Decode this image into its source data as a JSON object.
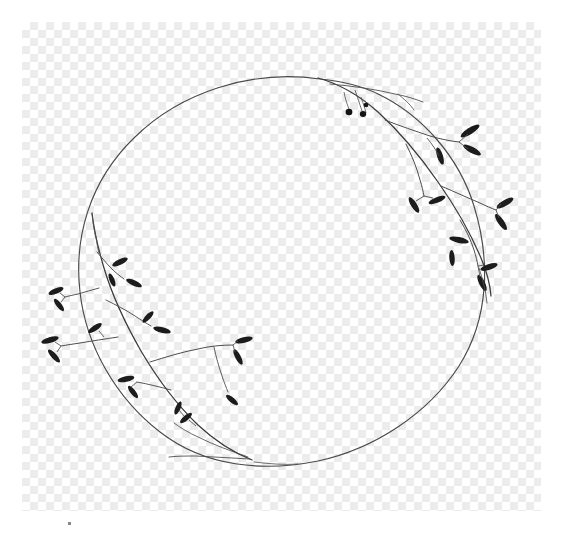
{
  "image": {
    "title": "Botanical Circle Wreath Line Drawing",
    "subject": "floral-wreath-branch-sprigs",
    "canvas_width": 566,
    "canvas_height": 534,
    "background_type": "transparency-checkerboard",
    "artwork_style": "monochrome-ink-line-drawing"
  },
  "colors": {
    "page_background": "#ffffff",
    "checker_light": "#ffffff",
    "checker_dark": "#ececec",
    "ring_stroke": "#4a4a4a",
    "branch_stroke": "#3a3a3a",
    "twig_stroke": "#4e4e4e",
    "leaf_fill": "#1c1c1c",
    "berry_fill": "#141414",
    "speck": "#8a8a8a"
  },
  "checkerboard": {
    "left": 22,
    "top": 22,
    "width": 519,
    "height": 489,
    "square_size": 8
  },
  "ring": {
    "center_x": 282,
    "center_y": 268,
    "radius": 204,
    "stroke_width": 1.1,
    "note": "thin open circle forming the wreath outline"
  },
  "sprigs": [
    {
      "name": "upper-right-sprig",
      "origin_x": 318,
      "origin_y": 80,
      "leaf_count": 11,
      "berry_count": 3,
      "direction": "descending-right"
    },
    {
      "name": "lower-left-sprig",
      "origin_x": 232,
      "origin_y": 456,
      "leaf_count": 14,
      "berry_count": 0,
      "direction": "ascending-left"
    }
  ],
  "marks": {
    "corner_speck": {
      "x": 68,
      "y": 522,
      "size": 3
    }
  }
}
